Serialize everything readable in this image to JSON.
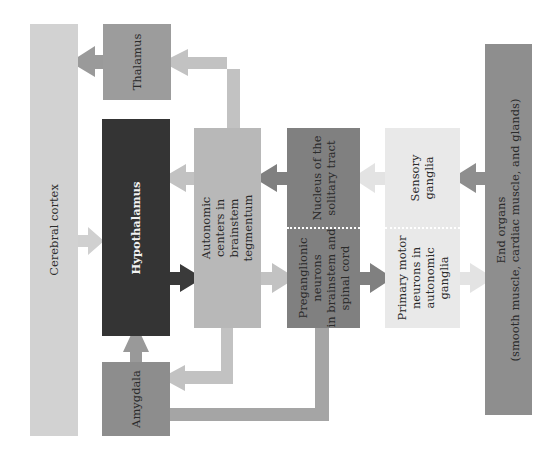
{
  "diagram": {
    "type": "flowchart",
    "orientation": "rotated -90deg text",
    "colors": {
      "cerebral_cortex": "#d2d2d2",
      "thalamus": "#9c9c9c",
      "hypothalamus": "#343434",
      "amygdala": "#8d8d8d",
      "autonomic_centers": "#b8b8b8",
      "nucleus_preganglionic": "#808080",
      "sensory_primary_motor": "#e9e9e9",
      "end_organs": "#8e8e8e",
      "arrow_light": "#bdbdbd",
      "arrow_mid": "#9a9a9a",
      "arrow_dark": "#3a3a3a",
      "arrow_pale": "#e3e3e3"
    },
    "nodes": {
      "cerebral_cortex": "Cerebral cortex",
      "thalamus": "Thalamus",
      "hypothalamus": "Hypothalamus",
      "amygdala": "Amygdala",
      "autonomic_centers": "Autonomic\ncenters in\nbrainstem\ntegmentum",
      "nucleus_solitary": "Nucleus of the\nsolitary tract",
      "preganglionic": "Preganglionic\nneurons\nin brainstem and\nspinal cord",
      "sensory_ganglia": "Sensory\nganglia",
      "primary_motor": "Primary motor\nneurons in\nautonomic\nganglia",
      "end_organs": "End organs\n(smooth muscle, cardiac muscle, and glands)"
    },
    "edges": [
      {
        "from": "Thalamus",
        "to": "Cerebral cortex"
      },
      {
        "from": "Autonomic centers in brainstem tegmentum",
        "to": "Thalamus"
      },
      {
        "from": "Cerebral cortex",
        "to": "Hypothalamus"
      },
      {
        "from": "Autonomic centers in brainstem tegmentum",
        "to": "Hypothalamus"
      },
      {
        "from": "Hypothalamus",
        "to": "Autonomic centers in brainstem tegmentum"
      },
      {
        "from": "Amygdala",
        "to": "Hypothalamus"
      },
      {
        "from": "Autonomic centers in brainstem tegmentum",
        "to": "Amygdala"
      },
      {
        "from": "Amygdala",
        "to": "Preganglionic neurons in brainstem and spinal cord"
      },
      {
        "from": "Nucleus of the solitary tract",
        "to": "Autonomic centers in brainstem tegmentum"
      },
      {
        "from": "Autonomic centers in brainstem tegmentum",
        "to": "Preganglionic neurons in brainstem and spinal cord"
      },
      {
        "from": "Sensory ganglia",
        "to": "Nucleus of the solitary tract"
      },
      {
        "from": "Preganglionic neurons in brainstem and spinal cord",
        "to": "Primary motor neurons in autonomic ganglia"
      },
      {
        "from": "End organs",
        "to": "Sensory ganglia"
      },
      {
        "from": "Primary motor neurons in autonomic ganglia",
        "to": "End organs"
      }
    ]
  }
}
